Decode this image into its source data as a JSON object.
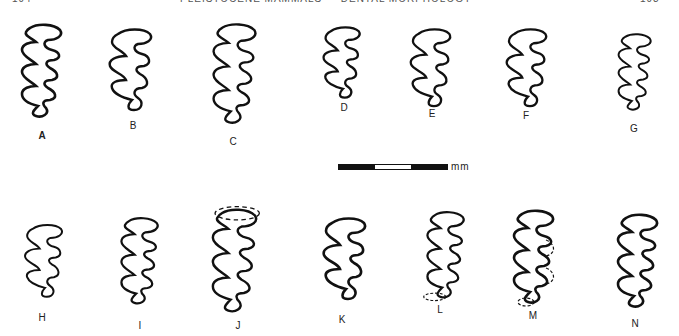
{
  "header": {
    "left_text": "194",
    "center_text": "PLEISTOCENE MAMMALS — DENTAL MORPHOLOGY",
    "right_text": "193"
  },
  "scale_bar": {
    "unit_label": "mm",
    "segments": [
      "black",
      "white",
      "black"
    ]
  },
  "figures": [
    {
      "label": "A",
      "row": 1
    },
    {
      "label": "B",
      "row": 1
    },
    {
      "label": "C",
      "row": 1
    },
    {
      "label": "D",
      "row": 1
    },
    {
      "label": "E",
      "row": 1
    },
    {
      "label": "F",
      "row": 1
    },
    {
      "label": "G",
      "row": 1
    },
    {
      "label": "H",
      "row": 2
    },
    {
      "label": "I",
      "row": 2
    },
    {
      "label": "J",
      "row": 2
    },
    {
      "label": "K",
      "row": 2
    },
    {
      "label": "L",
      "row": 2
    },
    {
      "label": "M",
      "row": 2
    },
    {
      "label": "N",
      "row": 2
    }
  ],
  "colors": {
    "ink": "#111111",
    "paper": "#ffffff"
  }
}
